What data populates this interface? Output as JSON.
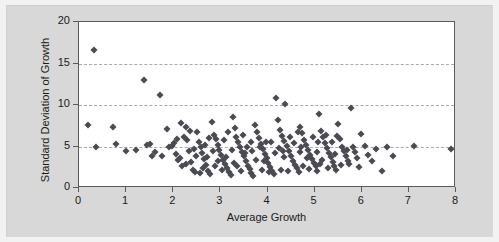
{
  "chart_data": {
    "type": "scatter",
    "title": "",
    "xlabel": "Average Growth",
    "ylabel": "Standard Deviation of Growth",
    "xlim": [
      0,
      8
    ],
    "ylim": [
      0,
      20
    ],
    "xticks": [
      0,
      1,
      2,
      3,
      4,
      5,
      6,
      7,
      8
    ],
    "yticks": [
      0,
      5,
      10,
      15,
      20
    ],
    "xtick_labels": [
      "0",
      "1",
      "2",
      "3",
      "4",
      "5",
      "6",
      "7",
      "8"
    ],
    "ytick_labels": [
      "0",
      "5",
      "10",
      "15",
      "20"
    ],
    "grid": "horizontal-dashed",
    "gridlines_y": [
      5,
      10,
      15
    ],
    "legend": null,
    "marker": "diamond",
    "marker_color": "#4a4a52",
    "plot_background": "#ffffff",
    "figure_background": "#d8d8d8",
    "axis_color": "#5b5b5b",
    "gridline_color": "#a8a8a8",
    "n_points": 182,
    "points": [
      [
        0.31,
        16.6
      ],
      [
        0.2,
        7.6
      ],
      [
        0.36,
        4.9
      ],
      [
        0.72,
        7.3
      ],
      [
        0.78,
        5.3
      ],
      [
        1.0,
        4.5
      ],
      [
        1.22,
        4.6
      ],
      [
        1.38,
        13.0
      ],
      [
        1.44,
        5.2
      ],
      [
        1.5,
        5.3
      ],
      [
        1.54,
        3.8
      ],
      [
        1.72,
        11.2
      ],
      [
        1.86,
        7.1
      ],
      [
        1.92,
        5.0
      ],
      [
        1.98,
        5.1
      ],
      [
        2.02,
        5.4
      ],
      [
        2.06,
        4.1
      ],
      [
        2.1,
        3.4
      ],
      [
        2.14,
        3.6
      ],
      [
        2.18,
        2.6
      ],
      [
        2.22,
        6.2
      ],
      [
        2.26,
        7.3
      ],
      [
        2.3,
        5.8
      ],
      [
        2.34,
        4.4
      ],
      [
        2.38,
        3.1
      ],
      [
        2.42,
        2.2
      ],
      [
        2.46,
        1.9
      ],
      [
        2.5,
        6.7
      ],
      [
        2.54,
        5.6
      ],
      [
        2.58,
        4.9
      ],
      [
        2.62,
        4.2
      ],
      [
        2.66,
        3.5
      ],
      [
        2.7,
        2.8
      ],
      [
        2.74,
        2.1
      ],
      [
        2.78,
        1.7
      ],
      [
        2.82,
        7.9
      ],
      [
        2.86,
        6.4
      ],
      [
        2.9,
        5.9
      ],
      [
        2.94,
        5.2
      ],
      [
        2.98,
        4.6
      ],
      [
        3.02,
        4.0
      ],
      [
        3.06,
        3.4
      ],
      [
        3.1,
        2.9
      ],
      [
        3.14,
        2.4
      ],
      [
        3.18,
        1.9
      ],
      [
        3.22,
        1.6
      ],
      [
        3.26,
        8.6
      ],
      [
        3.3,
        7.2
      ],
      [
        3.34,
        6.1
      ],
      [
        3.38,
        5.5
      ],
      [
        3.42,
        4.9
      ],
      [
        3.46,
        4.3
      ],
      [
        3.5,
        3.8
      ],
      [
        3.54,
        3.2
      ],
      [
        3.58,
        2.7
      ],
      [
        3.62,
        2.3
      ],
      [
        3.66,
        1.8
      ],
      [
        3.7,
        1.5
      ],
      [
        3.74,
        7.6
      ],
      [
        3.78,
        6.8
      ],
      [
        3.82,
        6.0
      ],
      [
        3.86,
        5.3
      ],
      [
        3.9,
        4.7
      ],
      [
        3.94,
        4.1
      ],
      [
        3.98,
        3.6
      ],
      [
        4.02,
        3.0
      ],
      [
        4.06,
        2.5
      ],
      [
        4.1,
        2.0
      ],
      [
        4.14,
        1.7
      ],
      [
        4.18,
        10.8
      ],
      [
        4.22,
        8.2
      ],
      [
        4.26,
        7.0
      ],
      [
        4.3,
        6.3
      ],
      [
        4.34,
        5.7
      ],
      [
        4.38,
        10.1
      ],
      [
        4.42,
        5.1
      ],
      [
        4.46,
        4.5
      ],
      [
        4.5,
        3.9
      ],
      [
        4.54,
        3.3
      ],
      [
        4.58,
        2.8
      ],
      [
        4.62,
        2.4
      ],
      [
        4.66,
        1.9
      ],
      [
        4.7,
        7.4
      ],
      [
        4.74,
        6.6
      ],
      [
        4.78,
        5.8
      ],
      [
        4.82,
        5.2
      ],
      [
        4.86,
        4.6
      ],
      [
        4.9,
        4.0
      ],
      [
        4.94,
        3.5
      ],
      [
        4.98,
        3.0
      ],
      [
        5.02,
        2.6
      ],
      [
        5.06,
        2.1
      ],
      [
        5.1,
        8.9
      ],
      [
        5.14,
        6.9
      ],
      [
        5.18,
        6.1
      ],
      [
        5.22,
        5.4
      ],
      [
        5.26,
        4.8
      ],
      [
        5.3,
        4.2
      ],
      [
        5.34,
        3.7
      ],
      [
        5.38,
        3.1
      ],
      [
        5.42,
        2.7
      ],
      [
        5.46,
        2.2
      ],
      [
        5.5,
        7.7
      ],
      [
        5.54,
        5.9
      ],
      [
        5.58,
        5.0
      ],
      [
        5.62,
        4.4
      ],
      [
        5.66,
        3.8
      ],
      [
        5.7,
        3.2
      ],
      [
        5.74,
        2.9
      ],
      [
        5.78,
        9.6
      ],
      [
        5.82,
        4.9
      ],
      [
        5.86,
        4.3
      ],
      [
        5.9,
        3.6
      ],
      [
        5.94,
        2.5
      ],
      [
        5.98,
        6.5
      ],
      [
        6.06,
        5.1
      ],
      [
        6.14,
        4.0
      ],
      [
        6.22,
        3.3
      ],
      [
        6.3,
        4.7
      ],
      [
        6.42,
        2.0
      ],
      [
        6.54,
        5.0
      ],
      [
        6.66,
        3.9
      ],
      [
        7.1,
        5.1
      ],
      [
        7.9,
        4.7
      ],
      [
        1.62,
        4.3
      ],
      [
        1.76,
        3.9
      ],
      [
        2.08,
        5.9
      ],
      [
        2.28,
        2.9
      ],
      [
        2.48,
        3.9
      ],
      [
        2.68,
        5.2
      ],
      [
        2.88,
        2.6
      ],
      [
        3.08,
        5.8
      ],
      [
        3.28,
        3.0
      ],
      [
        3.48,
        6.4
      ],
      [
        3.68,
        4.4
      ],
      [
        3.88,
        2.2
      ],
      [
        4.08,
        5.5
      ],
      [
        4.28,
        2.2
      ],
      [
        4.48,
        6.2
      ],
      [
        4.68,
        4.3
      ],
      [
        4.88,
        2.3
      ],
      [
        5.08,
        5.5
      ],
      [
        5.28,
        2.4
      ],
      [
        5.48,
        6.3
      ],
      [
        5.68,
        4.6
      ],
      [
        2.16,
        7.8
      ],
      [
        2.36,
        6.9
      ],
      [
        2.56,
        1.8
      ],
      [
        2.76,
        6.0
      ],
      [
        2.96,
        3.3
      ],
      [
        3.16,
        6.7
      ],
      [
        3.36,
        2.6
      ],
      [
        3.56,
        5.0
      ],
      [
        3.76,
        3.4
      ],
      [
        3.96,
        5.6
      ],
      [
        4.16,
        4.2
      ],
      [
        4.36,
        3.7
      ],
      [
        4.56,
        5.4
      ],
      [
        4.76,
        2.7
      ],
      [
        4.96,
        6.1
      ],
      [
        5.16,
        3.4
      ],
      [
        5.36,
        5.6
      ],
      [
        5.56,
        2.8
      ],
      [
        2.44,
        4.7
      ],
      [
        2.64,
        2.4
      ],
      [
        2.84,
        4.5
      ],
      [
        3.04,
        2.2
      ],
      [
        3.24,
        4.6
      ],
      [
        3.44,
        2.0
      ],
      [
        3.64,
        5.6
      ],
      [
        3.84,
        4.9
      ],
      [
        4.04,
        1.9
      ],
      [
        4.24,
        4.8
      ],
      [
        4.44,
        2.0
      ],
      [
        4.64,
        6.8
      ],
      [
        4.84,
        3.6
      ],
      [
        5.04,
        4.3
      ],
      [
        5.24,
        6.4
      ],
      [
        5.44,
        4.1
      ],
      [
        2.72,
        3.7
      ],
      [
        3.12,
        3.7
      ],
      [
        3.52,
        4.2
      ],
      [
        3.92,
        3.2
      ],
      [
        4.32,
        4.4
      ],
      [
        4.72,
        5.0
      ],
      [
        5.12,
        2.9
      ]
    ]
  }
}
